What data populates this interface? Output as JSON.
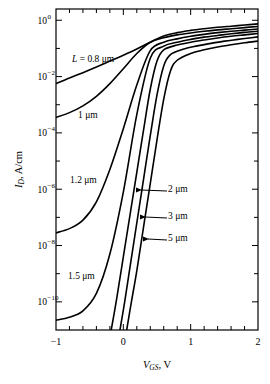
{
  "figure": {
    "background": "#ffffff",
    "line_color": "#000000",
    "text_color": "#000000"
  },
  "chart_data": {
    "type": "line",
    "title": "",
    "subtitle": "",
    "xlabel": "V_GS, V",
    "xlabel_parts": {
      "italic": "V",
      "subscript": "GS",
      "units": ", V"
    },
    "ylabel": "I_D, A/cm",
    "ylabel_parts": {
      "italic": "I",
      "subscript": "D",
      "units": ", A/cm"
    },
    "xlim": [
      -1,
      2
    ],
    "ylim_log10": [
      -11,
      0.4
    ],
    "yscale": "log",
    "grid": false,
    "legend_position": "inline-annotations",
    "x_major_ticks": [
      -1,
      0,
      1,
      2
    ],
    "x_major_tick_labels": [
      "-1",
      "0",
      "1",
      "2"
    ],
    "x_minor_tick_step": 0.2,
    "y_major_ticks_log10": [
      0,
      -2,
      -4,
      -6,
      -8,
      -10
    ],
    "y_major_tick_labels": [
      "10^0",
      "10^-2",
      "10^-4",
      "10^-6",
      "10^-8",
      "10^-10"
    ],
    "y_major_tick_mantissa": [
      "10",
      "10",
      "10",
      "10",
      "10",
      "10"
    ],
    "y_major_tick_exponents": [
      "0",
      "-2",
      "-4",
      "-6",
      "-8",
      "-10"
    ],
    "y_minor_ticks_log10": [
      -1,
      -3,
      -5,
      -7,
      -9
    ],
    "series": [
      {
        "name": "L = 0.8 um",
        "label": "L = 0.8 μm",
        "label_has_italic_L": true,
        "annotation_kind": "inline-text",
        "x": [
          -1.0,
          -0.8,
          -0.6,
          -0.4,
          -0.2,
          0.0,
          0.2,
          0.4,
          0.6,
          0.8,
          1.0,
          1.2,
          1.4,
          1.6,
          1.8,
          2.0
        ],
        "y_log10": [
          -2.25,
          -2.05,
          -1.86,
          -1.66,
          -1.45,
          -1.24,
          -1.02,
          -0.78,
          -0.56,
          -0.44,
          -0.36,
          -0.3,
          -0.25,
          -0.21,
          -0.17,
          -0.13
        ]
      },
      {
        "name": "L = 1 um",
        "label": "1 μm",
        "annotation_kind": "inline-text",
        "x": [
          -1.0,
          -0.8,
          -0.6,
          -0.4,
          -0.2,
          0.0,
          0.2,
          0.4,
          0.6,
          0.8,
          1.0,
          1.2,
          1.4,
          1.6,
          1.8,
          2.0
        ],
        "y_log10": [
          -3.45,
          -3.28,
          -3.04,
          -2.7,
          -2.25,
          -1.72,
          -1.18,
          -0.78,
          -0.62,
          -0.52,
          -0.45,
          -0.39,
          -0.34,
          -0.3,
          -0.26,
          -0.22
        ]
      },
      {
        "name": "L = 1.2 um",
        "label": "1.2 μm",
        "annotation_kind": "inline-text",
        "x": [
          -1.0,
          -0.8,
          -0.6,
          -0.4,
          -0.2,
          0.0,
          0.2,
          0.4,
          0.6,
          0.8,
          1.0,
          1.2,
          1.4,
          1.6,
          1.8,
          2.0
        ],
        "y_log10": [
          -7.55,
          -7.4,
          -7.1,
          -6.45,
          -5.3,
          -3.85,
          -2.3,
          -1.08,
          -0.78,
          -0.66,
          -0.57,
          -0.5,
          -0.44,
          -0.39,
          -0.35,
          -0.31
        ]
      },
      {
        "name": "L = 1.5 um",
        "label": "1.5 μm",
        "annotation_kind": "inline-text",
        "x": [
          -1.0,
          -0.8,
          -0.6,
          -0.4,
          -0.2,
          0.0,
          0.2,
          0.4,
          0.6,
          0.8,
          1.0,
          1.2,
          1.4,
          1.6,
          1.8,
          2.0
        ],
        "y_log10": [
          -10.65,
          -10.55,
          -10.32,
          -9.7,
          -8.3,
          -6.1,
          -3.35,
          -1.35,
          -0.92,
          -0.78,
          -0.68,
          -0.6,
          -0.54,
          -0.48,
          -0.43,
          -0.39
        ]
      },
      {
        "name": "L = 2 um",
        "label": "2 μm",
        "annotation_kind": "leader-arrow",
        "x": [
          -0.18,
          -0.1,
          0.0,
          0.1,
          0.2,
          0.3,
          0.4,
          0.5,
          0.6,
          0.8,
          1.0,
          1.2,
          1.4,
          1.6,
          1.8,
          2.0
        ],
        "y_log10": [
          -11.0,
          -9.9,
          -8.4,
          -6.9,
          -5.4,
          -3.9,
          -2.45,
          -1.45,
          -1.05,
          -0.88,
          -0.78,
          -0.7,
          -0.63,
          -0.57,
          -0.52,
          -0.47
        ]
      },
      {
        "name": "L = 3 um",
        "label": "3 μm",
        "annotation_kind": "leader-arrow",
        "x": [
          -0.05,
          0.02,
          0.1,
          0.2,
          0.3,
          0.4,
          0.5,
          0.6,
          0.7,
          0.9,
          1.1,
          1.3,
          1.5,
          1.7,
          1.9,
          2.0
        ],
        "y_log10": [
          -11.0,
          -10.0,
          -8.75,
          -7.2,
          -5.65,
          -4.1,
          -2.65,
          -1.62,
          -1.22,
          -1.02,
          -0.91,
          -0.82,
          -0.74,
          -0.68,
          -0.62,
          -0.59
        ]
      },
      {
        "name": "L = 5 um",
        "label": "5 μm",
        "annotation_kind": "leader-arrow",
        "x": [
          0.05,
          0.12,
          0.2,
          0.3,
          0.4,
          0.5,
          0.6,
          0.7,
          0.8,
          1.0,
          1.2,
          1.4,
          1.6,
          1.8,
          2.0
        ],
        "y_log10": [
          -11.0,
          -10.0,
          -8.9,
          -7.35,
          -5.8,
          -4.25,
          -2.8,
          -1.8,
          -1.42,
          -1.18,
          -1.05,
          -0.95,
          -0.87,
          -0.8,
          -0.74
        ]
      }
    ],
    "annotations": [
      {
        "text": "L = 0.8 μm",
        "x_px": 72,
        "y_px": 62,
        "italic_prefix": "L"
      },
      {
        "text": "1 μm",
        "x_px": 78,
        "y_px": 118
      },
      {
        "text": "1.2 μm",
        "x_px": 70,
        "y_px": 183
      },
      {
        "text": "1.5 μm",
        "x_px": 68,
        "y_px": 279
      },
      {
        "text": "2 μm",
        "x_px": 168,
        "y_px": 192,
        "leader_from_px": [
          167,
          191
        ],
        "leader_to_px": [
          141,
          190
        ]
      },
      {
        "text": "3 μm",
        "x_px": 168,
        "y_px": 219,
        "leader_from_px": [
          167,
          218
        ],
        "leader_to_px": [
          145,
          217
        ]
      },
      {
        "text": "5 μm",
        "x_px": 168,
        "y_px": 241,
        "leader_from_px": [
          167,
          240
        ],
        "leader_to_px": [
          148,
          239
        ]
      }
    ]
  }
}
